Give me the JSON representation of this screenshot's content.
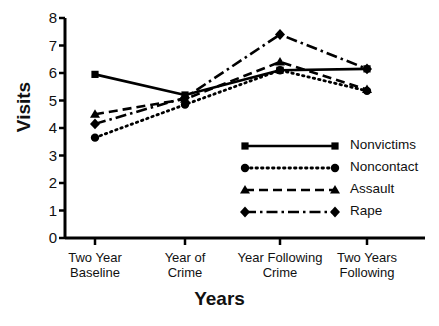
{
  "chart_data": {
    "type": "line",
    "title": "",
    "xlabel": "Years",
    "ylabel": "Visits",
    "categories": [
      "Two Year Baseline",
      "Year of Crime",
      "Year Following Crime",
      "Two Years Following"
    ],
    "category_lines": [
      [
        "Two Year",
        "Baseline"
      ],
      [
        "Year of",
        "Crime"
      ],
      [
        "Year Following",
        "Crime"
      ],
      [
        "Two Years",
        "Following"
      ]
    ],
    "ylim": [
      0,
      8
    ],
    "yticks": [
      0,
      1,
      2,
      3,
      4,
      5,
      6,
      7,
      8
    ],
    "ytick_labels": [
      "0",
      "1",
      "2",
      "3",
      "4",
      "5",
      "6",
      "7",
      "8"
    ],
    "grid": false,
    "legend_position": "center-right",
    "series": [
      {
        "name": "Nonvictims",
        "marker": "square",
        "line_style": "solid",
        "color": "#000000",
        "values": [
          5.95,
          5.2,
          6.1,
          6.15
        ]
      },
      {
        "name": "Noncontact",
        "marker": "circle",
        "line_style": "dotted",
        "color": "#000000",
        "values": [
          3.65,
          4.85,
          6.1,
          5.35
        ]
      },
      {
        "name": "Assault",
        "marker": "triangle",
        "line_style": "dashed",
        "color": "#000000",
        "values": [
          4.5,
          5.05,
          6.4,
          5.4
        ]
      },
      {
        "name": "Rape",
        "marker": "diamond",
        "line_style": "dash-dot",
        "color": "#000000",
        "values": [
          4.15,
          5.1,
          7.4,
          6.15
        ]
      }
    ]
  },
  "legend": {
    "entries": [
      {
        "label": "Nonvictims"
      },
      {
        "label": "Noncontact"
      },
      {
        "label": "Assault"
      },
      {
        "label": "Rape"
      }
    ]
  }
}
